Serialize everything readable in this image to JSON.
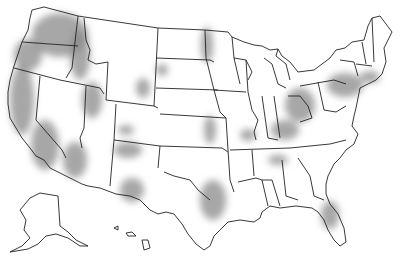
{
  "map": {
    "subject": "United States state outline map with shaded regions",
    "colors": {
      "background": "#ffffff",
      "outline": "#222222",
      "shade": "#8a8a8a"
    },
    "shaded_regions": [
      {
        "name": "pacific-northwest-washington",
        "cx": 60,
        "cy": 35,
        "rx": 28,
        "ry": 22
      },
      {
        "name": "western-oregon",
        "cx": 28,
        "cy": 55,
        "rx": 14,
        "ry": 16
      },
      {
        "name": "idaho-panhandle",
        "cx": 80,
        "cy": 55,
        "rx": 10,
        "ry": 25
      },
      {
        "name": "northern-california-coast",
        "cx": 22,
        "cy": 100,
        "rx": 12,
        "ry": 35
      },
      {
        "name": "nevada-utah-west",
        "cx": 92,
        "cy": 100,
        "rx": 10,
        "ry": 18
      },
      {
        "name": "wyoming-east",
        "cx": 143,
        "cy": 88,
        "rx": 7,
        "ry": 10
      },
      {
        "name": "south-dakota-west",
        "cx": 162,
        "cy": 70,
        "rx": 6,
        "ry": 6
      },
      {
        "name": "north-dakota-east",
        "cx": 207,
        "cy": 45,
        "rx": 6,
        "ry": 18
      },
      {
        "name": "southern-california",
        "cx": 45,
        "cy": 145,
        "rx": 14,
        "ry": 25
      },
      {
        "name": "arizona-west",
        "cx": 75,
        "cy": 160,
        "rx": 12,
        "ry": 18
      },
      {
        "name": "colorado-utah-south",
        "cx": 126,
        "cy": 130,
        "rx": 8,
        "ry": 5
      },
      {
        "name": "new-mexico-north",
        "cx": 128,
        "cy": 150,
        "rx": 14,
        "ry": 8
      },
      {
        "name": "new-mexico-south",
        "cx": 132,
        "cy": 190,
        "rx": 12,
        "ry": 12
      },
      {
        "name": "kansas-east",
        "cx": 210,
        "cy": 130,
        "rx": 6,
        "ry": 14
      },
      {
        "name": "missouri-central",
        "cx": 248,
        "cy": 135,
        "rx": 8,
        "ry": 6
      },
      {
        "name": "texas-east",
        "cx": 213,
        "cy": 200,
        "rx": 13,
        "ry": 20
      },
      {
        "name": "ohio",
        "cx": 300,
        "cy": 105,
        "rx": 15,
        "ry": 17
      },
      {
        "name": "indiana-kentucky",
        "cx": 285,
        "cy": 130,
        "rx": 14,
        "ry": 10
      },
      {
        "name": "pennsylvania-new-york",
        "cx": 345,
        "cy": 85,
        "rx": 18,
        "ry": 12
      },
      {
        "name": "southern-new-england",
        "cx": 370,
        "cy": 77,
        "rx": 10,
        "ry": 6
      },
      {
        "name": "tennessee",
        "cx": 278,
        "cy": 160,
        "rx": 10,
        "ry": 5
      },
      {
        "name": "florida-central",
        "cx": 330,
        "cy": 215,
        "rx": 9,
        "ry": 14
      }
    ]
  }
}
